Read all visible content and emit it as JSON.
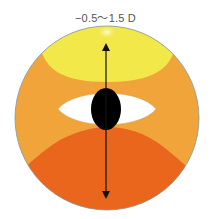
{
  "title": "−0.5〜1.5 D",
  "colors": {
    "yellow_zone": "#f2e84a",
    "mid_orange_zone": "#f0a43a",
    "dark_orange_zone": "#e9661c",
    "highlight": "#fbf6c8",
    "eye_white": "#ffffff",
    "pupil": "#000000",
    "arrow": "#111111",
    "outline": "#7f9aa8"
  },
  "diagram": {
    "shape": "lens-circle",
    "zones": [
      "top yellow zone",
      "middle orange zone",
      "bottom dark orange zone"
    ],
    "eye": "white almond eye with black pupil in center",
    "arrow": "double-headed vertical arrow spanning top to bottom"
  }
}
